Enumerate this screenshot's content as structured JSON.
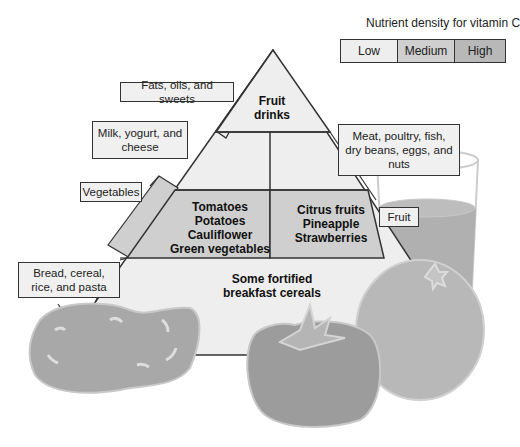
{
  "legend": {
    "title": "Nutrient density for vitamin C",
    "levels": [
      {
        "label": "Low",
        "color": "#eeeeee"
      },
      {
        "label": "Medium",
        "color": "#cfcfcf"
      },
      {
        "label": "High",
        "color": "#b8b8b8"
      }
    ]
  },
  "pyramid": {
    "labels": {
      "fats": "Fats, oils, and sweets",
      "milk": "Milk, yogurt, and cheese",
      "vegetables": "Vegetables",
      "bread": "Bread, cereal, rice, and pasta",
      "meat": "Meat, poultry, fish, dry beans, eggs, and nuts",
      "fruit": "Fruit"
    },
    "cells": {
      "top": "Fruit drinks",
      "vegetables_items": [
        "Tomatoes",
        "Potatoes",
        "Cauliflower",
        "Green vegetables"
      ],
      "fruit_items": [
        "Citrus fruits",
        "Pineapple",
        "Strawberries"
      ],
      "bread_items": [
        "Some fortified",
        "breakfast cereals"
      ]
    }
  },
  "colors": {
    "low": "#eeeeee",
    "medium": "#cfcfcf",
    "high": "#b5b5b5",
    "juice": "#b0b0b0",
    "outline": "#333333"
  }
}
